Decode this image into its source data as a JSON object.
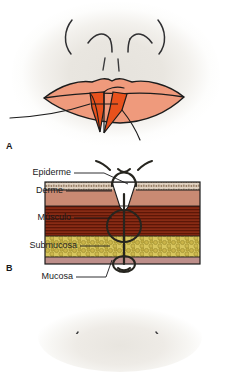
{
  "figure": {
    "type": "medical-illustration",
    "language": "pt"
  },
  "panels": [
    {
      "id": "A",
      "label": "A",
      "caption": "",
      "view": "frontal view of lower face with vertical full-thickness lip laceration"
    },
    {
      "id": "B",
      "label": "B",
      "caption": "",
      "view": "cross-section of lip tissue layers with suture placement",
      "labels": [
        {
          "id": "epiderme",
          "text": "Epiderme"
        },
        {
          "id": "derme",
          "text": "Derme"
        },
        {
          "id": "musculo",
          "text": "Músculo"
        },
        {
          "id": "submucosa",
          "text": "Submucosa"
        },
        {
          "id": "mucosa",
          "text": "Mucosa"
        }
      ]
    },
    {
      "id": "C",
      "label": "",
      "caption": "",
      "view": "partially visible third panel at bottom edge"
    }
  ],
  "colors": {
    "background": "#ffffff",
    "vignette": "#e6e3dd",
    "skin_face": "#e9e6e0",
    "lip_vermillion": "#ef9a7c",
    "wound_deep": "#e8511c",
    "epidermis": "#d9c3b0",
    "dermis": "#c98a73",
    "muscle": "#7d2410",
    "submucosa": "#c9b348",
    "mucosa": "#bd8e8a",
    "outline": "#1c1c1c",
    "suture_thread": "#2a2a28",
    "label_text": "#1a1a1c"
  }
}
